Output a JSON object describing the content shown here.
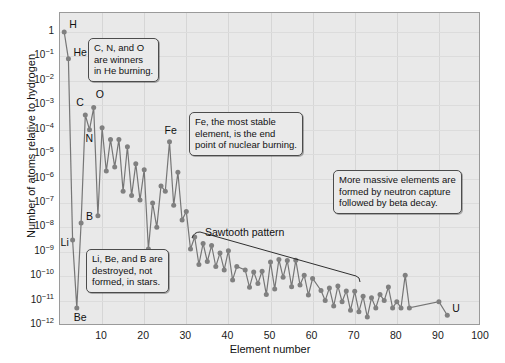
{
  "chart_data": {
    "type": "scatter",
    "title": "",
    "xlabel": "Element number",
    "ylabel": "Number of atoms relative to hydrogen",
    "xlim": [
      0,
      100
    ],
    "ylim": [
      1e-12,
      1
    ],
    "yscale": "log",
    "grid": true,
    "legend": "none",
    "xticks": [
      "10",
      "20",
      "30",
      "40",
      "50",
      "60",
      "70",
      "80",
      "90",
      "100"
    ],
    "xtick_values": [
      10,
      20,
      30,
      40,
      50,
      60,
      70,
      80,
      90,
      100
    ],
    "ytick_labels": [
      "1",
      "10-1",
      "10-2",
      "10-3",
      "10-4",
      "10-5",
      "10-6",
      "10-7",
      "10-8",
      "10-9",
      "10-10",
      "10-11",
      "10-12"
    ],
    "ytick_exponents": [
      "",
      "-1",
      "-2",
      "-3",
      "-4",
      "-5",
      "-6",
      "-7",
      "-8",
      "-9",
      "-10",
      "-11",
      "-12"
    ],
    "ytick_values": [
      1,
      0.1,
      0.01,
      0.001,
      0.0001,
      1e-05,
      1e-06,
      1e-07,
      1e-08,
      1e-09,
      1e-10,
      1e-11,
      1e-12
    ],
    "series_name": "Solar system abundance",
    "point_color": "#808080",
    "line_color": "#767676",
    "plot_background": "#e9e9e9",
    "x": [
      1,
      2,
      3,
      4,
      5,
      6,
      7,
      8,
      9,
      10,
      11,
      12,
      13,
      14,
      15,
      16,
      17,
      18,
      19,
      20,
      21,
      22,
      23,
      24,
      25,
      26,
      27,
      28,
      29,
      30,
      31,
      32,
      33,
      34,
      35,
      36,
      37,
      38,
      39,
      40,
      41,
      42,
      44,
      45,
      46,
      47,
      48,
      49,
      50,
      51,
      52,
      53,
      54,
      55,
      56,
      57,
      58,
      59,
      60,
      62,
      63,
      64,
      65,
      66,
      67,
      68,
      69,
      70,
      71,
      72,
      73,
      74,
      75,
      76,
      77,
      78,
      79,
      80,
      81,
      82,
      83,
      90,
      92
    ],
    "y": [
      1.0,
      0.08,
      3e-09,
      5e-12,
      1.5e-08,
      0.0004,
      0.0001,
      0.0008,
      3e-08,
      0.00012,
      2e-06,
      4e-05,
      3e-06,
      4e-05,
      3e-07,
      2e-05,
      2e-07,
      4e-06,
      1.3e-07,
      2.3e-06,
      1.3e-09,
      1e-07,
      1e-08,
      5e-07,
      3e-07,
      3.2e-05,
      8e-08,
      1.8e-06,
      2e-08,
      4.5e-08,
      1.3e-09,
      4e-09,
      3e-10,
      2.2e-09,
      4e-10,
      1.8e-09,
      2.5e-10,
      9e-10,
      1.8e-10,
      1.1e-09,
      7e-11,
      2.5e-10,
      1.8e-10,
      3.5e-11,
      1.5e-10,
      5e-11,
      1.6e-10,
      1.8e-11,
      3.8e-10,
      3e-11,
      4.8e-10,
      9e-11,
      4.4e-10,
      3.7e-11,
      4.5e-10,
      4.4e-11,
      1.1e-10,
      1.7e-11,
      8e-11,
      2.6e-11,
      1e-11,
      3.3e-11,
      6e-12,
      4e-11,
      9e-12,
      2.5e-11,
      4e-12,
      2.4e-11,
      3.5e-12,
      1.5e-11,
      2.1e-12,
      1.3e-11,
      5e-12,
      1.8e-11,
      1e-11,
      3.6e-11,
      5e-12,
      9e-12,
      5e-12,
      1.1e-10,
      5e-12,
      9e-12,
      2.5e-12
    ],
    "point_labels": [
      {
        "name": "H",
        "element": 1,
        "text": "H"
      },
      {
        "name": "He",
        "element": 2,
        "text": "He"
      },
      {
        "name": "Li",
        "element": 3,
        "text": "Li"
      },
      {
        "name": "Be",
        "element": 4,
        "text": "Be"
      },
      {
        "name": "B",
        "element": 5,
        "text": "B"
      },
      {
        "name": "C",
        "element": 6,
        "text": "C"
      },
      {
        "name": "N",
        "element": 7,
        "text": "N"
      },
      {
        "name": "O",
        "element": 8,
        "text": "O"
      },
      {
        "name": "Fe",
        "element": 26,
        "text": "Fe"
      },
      {
        "name": "U",
        "element": 92,
        "text": "U"
      }
    ],
    "annotations": [
      {
        "id": "cno-callout",
        "lines": [
          "C, N, and O",
          "are winners",
          "in He burning."
        ]
      },
      {
        "id": "fe-callout",
        "lines": [
          "Fe, the most stable",
          "element, is the end",
          "point of nuclear burning."
        ]
      },
      {
        "id": "libeb-callout",
        "lines": [
          "Li, Be, and B are",
          "destroyed, not",
          "formed, in stars."
        ]
      },
      {
        "id": "neutron-capture-callout",
        "lines": [
          "More massive elements are",
          "formed by neutron capture",
          "followed by beta decay."
        ]
      }
    ],
    "sawtooth_label": "Sawtooth pattern"
  }
}
